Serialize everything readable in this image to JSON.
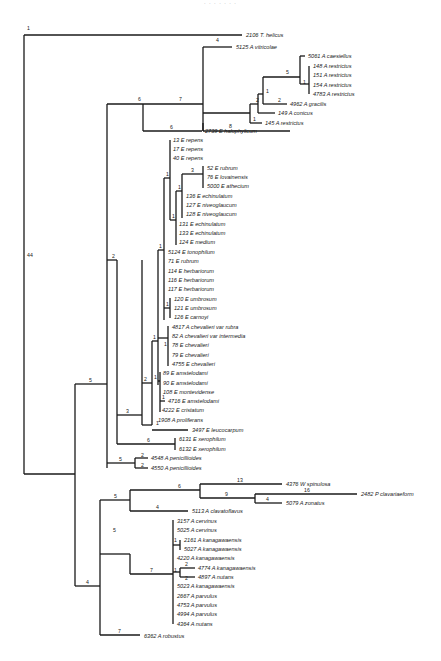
{
  "figure": {
    "type": "phylogenetic-tree",
    "header_text": "· · · · · · ·"
  },
  "taxa": [
    {
      "id": "t0",
      "label": "2106 T. helicus",
      "x": 250,
      "y": 36
    },
    {
      "id": "t1",
      "label": "5125 A vitricolae",
      "x": 236,
      "y": 45
    },
    {
      "id": "t2",
      "label": "5061 A caesiellus",
      "x": 308,
      "y": 56
    },
    {
      "id": "t3",
      "label": "148 A restrictus",
      "x": 315,
      "y": 66
    },
    {
      "id": "t4",
      "label": "151 A restrictus",
      "x": 315,
      "y": 75
    },
    {
      "id": "t5",
      "label": "154 A restrictus",
      "x": 315,
      "y": 85
    },
    {
      "id": "t6",
      "label": "4783 A restrictus",
      "x": 315,
      "y": 94
    },
    {
      "id": "t7",
      "label": "4962 A gracilis",
      "x": 290,
      "y": 104
    },
    {
      "id": "t8",
      "label": "149 A conicus",
      "x": 278,
      "y": 113
    },
    {
      "id": "t9",
      "label": "145 A restrictus",
      "x": 265,
      "y": 123
    },
    {
      "id": "t10",
      "label": "2739 E halophylicum",
      "x": 205,
      "y": 131
    },
    {
      "id": "t11",
      "label": "13 E repens",
      "x": 173,
      "y": 140
    },
    {
      "id": "t12",
      "label": "17 E repens",
      "x": 173,
      "y": 149
    },
    {
      "id": "t13",
      "label": "40 E repens",
      "x": 173,
      "y": 158
    },
    {
      "id": "t14",
      "label": "52 E rubrum",
      "x": 207,
      "y": 168
    },
    {
      "id": "t15",
      "label": "76 E lovainensis",
      "x": 207,
      "y": 177
    },
    {
      "id": "t16",
      "label": "5000 E athecium",
      "x": 207,
      "y": 186
    },
    {
      "id": "t17",
      "label": "136 E echinulatum",
      "x": 192,
      "y": 196
    },
    {
      "id": "t18",
      "label": "127 E niveoglaucum",
      "x": 192,
      "y": 205
    },
    {
      "id": "t19",
      "label": "128 E niveoglaucum",
      "x": 192,
      "y": 214
    },
    {
      "id": "t20",
      "label": "131 E echinulatum",
      "x": 184,
      "y": 224
    },
    {
      "id": "t21",
      "label": "133 E echinulatum",
      "x": 184,
      "y": 233
    },
    {
      "id": "t22",
      "label": "124 E medium",
      "x": 184,
      "y": 242
    },
    {
      "id": "t23",
      "label": "5124 E tonophilum",
      "x": 168,
      "y": 252
    },
    {
      "id": "t24",
      "label": "71 E rubrum",
      "x": 168,
      "y": 261
    },
    {
      "id": "t25",
      "label": "114 E herbariorum",
      "x": 168,
      "y": 271
    },
    {
      "id": "t26",
      "label": "116 E herbariorum",
      "x": 168,
      "y": 280
    },
    {
      "id": "t27",
      "label": "117 E herbariorum",
      "x": 168,
      "y": 289
    },
    {
      "id": "t28",
      "label": "120 E umbrosum",
      "x": 175,
      "y": 299
    },
    {
      "id": "t29",
      "label": "121 E umbrosum",
      "x": 175,
      "y": 308
    },
    {
      "id": "t30",
      "label": "126 E carnoyi",
      "x": 175,
      "y": 317
    },
    {
      "id": "t31",
      "label": "4817 A chevalieri var rubra",
      "x": 172,
      "y": 327
    },
    {
      "id": "t32",
      "label": "82 A chevalieri var intermedia",
      "x": 172,
      "y": 336
    },
    {
      "id": "t33",
      "label": "78 E chevalieri",
      "x": 172,
      "y": 345
    },
    {
      "id": "t34",
      "label": "79 E chevalieri",
      "x": 172,
      "y": 355
    },
    {
      "id": "t35",
      "label": "4755 E chevalieri",
      "x": 172,
      "y": 364
    },
    {
      "id": "t36",
      "label": "89 E amstelodami",
      "x": 163,
      "y": 373
    },
    {
      "id": "t37",
      "label": "90 E amstelodami",
      "x": 163,
      "y": 383
    },
    {
      "id": "t38",
      "label": "108 E montevidense",
      "x": 163,
      "y": 392
    },
    {
      "id": "t39",
      "label": "4716 E amstelodami",
      "x": 168,
      "y": 401
    },
    {
      "id": "t40",
      "label": "4222 E cristatum",
      "x": 162,
      "y": 410
    },
    {
      "id": "t41",
      "label": "1908 A proliferans",
      "x": 158,
      "y": 420
    },
    {
      "id": "t42",
      "label": "3497 E leucocarpum",
      "x": 192,
      "y": 430
    },
    {
      "id": "t43",
      "label": "6131 E xerophilum",
      "x": 180,
      "y": 439
    },
    {
      "id": "t44",
      "label": "6132 E xerophilum",
      "x": 180,
      "y": 449
    },
    {
      "id": "t45",
      "label": "4548 A penicillioides",
      "x": 152,
      "y": 458
    },
    {
      "id": "t46",
      "label": "4550 A penicillioides",
      "x": 152,
      "y": 467
    },
    {
      "id": "t47",
      "label": "4376 W spinulosa",
      "x": 286,
      "y": 484
    },
    {
      "id": "t48",
      "label": "2482 P clavariaeform",
      "x": 362,
      "y": 494
    },
    {
      "id": "t49",
      "label": "5079 A zonatus",
      "x": 286,
      "y": 503
    },
    {
      "id": "t50",
      "label": "5113 A clavatoflavus",
      "x": 193,
      "y": 512
    },
    {
      "id": "t51",
      "label": "3157 A cervinus",
      "x": 178,
      "y": 521
    },
    {
      "id": "t52",
      "label": "5025 A cervinus",
      "x": 178,
      "y": 530
    },
    {
      "id": "t53",
      "label": "2161 A kanagawaensis",
      "x": 185,
      "y": 540
    },
    {
      "id": "t54",
      "label": "5027 A kanagawaensis",
      "x": 185,
      "y": 549
    },
    {
      "id": "t55",
      "label": "4220 A kanagawaensis",
      "x": 178,
      "y": 558
    },
    {
      "id": "t56",
      "label": "4774 A kanagawaensis",
      "x": 198,
      "y": 568
    },
    {
      "id": "t57",
      "label": "4897 A nutans",
      "x": 198,
      "y": 577
    },
    {
      "id": "t58",
      "label": "5023 A kanagawaensis",
      "x": 178,
      "y": 586
    },
    {
      "id": "t59",
      "label": "2667 A parvulus",
      "x": 178,
      "y": 596
    },
    {
      "id": "t60",
      "label": "4753 A parvulus",
      "x": 178,
      "y": 605
    },
    {
      "id": "t61",
      "label": "4994 A parvulus",
      "x": 178,
      "y": 614
    },
    {
      "id": "t62",
      "label": "4364 A nutans",
      "x": 178,
      "y": 624
    },
    {
      "id": "t63",
      "label": "6362 A robustus",
      "x": 145,
      "y": 636
    }
  ],
  "branch_lengths": [
    {
      "label": "1",
      "x": 27,
      "y": 30
    },
    {
      "label": "44",
      "x": 27,
      "y": 257
    },
    {
      "label": "4",
      "x": 216,
      "y": 42
    },
    {
      "label": "7",
      "x": 179,
      "y": 74
    },
    {
      "label": "6",
      "x": 138,
      "y": 102
    },
    {
      "label": "8",
      "x": 229,
      "y": 110
    },
    {
      "label": "5",
      "x": 286,
      "y": 63
    },
    {
      "label": "1",
      "x": 302,
      "y": 77
    },
    {
      "label": "1",
      "x": 267,
      "y": 86
    },
    {
      "label": "2",
      "x": 260,
      "y": 97
    },
    {
      "label": "2",
      "x": 279,
      "y": 101
    },
    {
      "label": "1",
      "x": 256,
      "y": 120
    },
    {
      "label": "6",
      "x": 180,
      "y": 128
    },
    {
      "label": "1",
      "x": 166,
      "y": 176
    },
    {
      "label": "3",
      "x": 191,
      "y": 174
    },
    {
      "label": "1",
      "x": 178,
      "y": 189
    },
    {
      "label": "1",
      "x": 172,
      "y": 213
    },
    {
      "label": "2",
      "x": 112,
      "y": 257
    },
    {
      "label": "1",
      "x": 158,
      "y": 248
    },
    {
      "label": "1",
      "x": 168,
      "y": 306
    },
    {
      "label": "1",
      "x": 153,
      "y": 333
    },
    {
      "label": "1",
      "x": 166,
      "y": 345
    },
    {
      "label": "2",
      "x": 142,
      "y": 381
    },
    {
      "label": "1",
      "x": 158,
      "y": 379
    },
    {
      "label": "1",
      "x": 162,
      "y": 399
    },
    {
      "label": "3",
      "x": 126,
      "y": 415
    },
    {
      "label": "6",
      "x": 155,
      "y": 444
    },
    {
      "label": "1",
      "x": 155,
      "y": 424
    },
    {
      "label": "5",
      "x": 91,
      "y": 430
    },
    {
      "label": "5",
      "x": 120,
      "y": 463
    },
    {
      "label": "2",
      "x": 142,
      "y": 460
    },
    {
      "label": "2",
      "x": 142,
      "y": 470
    },
    {
      "label": "6",
      "x": 179,
      "y": 487
    },
    {
      "label": "13",
      "x": 237,
      "y": 481
    },
    {
      "label": "16",
      "x": 327,
      "y": 491
    },
    {
      "label": "9",
      "x": 239,
      "y": 495
    },
    {
      "label": "4",
      "x": 276,
      "y": 500
    },
    {
      "label": "5",
      "x": 115,
      "y": 496
    },
    {
      "label": "4",
      "x": 173,
      "y": 508
    },
    {
      "label": "1",
      "x": 176,
      "y": 542
    },
    {
      "label": "5",
      "x": 115,
      "y": 534
    },
    {
      "label": "7",
      "x": 151,
      "y": 570
    },
    {
      "label": "2",
      "x": 186,
      "y": 565
    },
    {
      "label": "1",
      "x": 178,
      "y": 572
    },
    {
      "label": "2",
      "x": 186,
      "y": 579
    },
    {
      "label": "4",
      "x": 88,
      "y": 581
    },
    {
      "label": "7",
      "x": 120,
      "y": 633
    }
  ],
  "colors": {
    "ink": "#1a1a1a",
    "background": "#ffffff"
  }
}
